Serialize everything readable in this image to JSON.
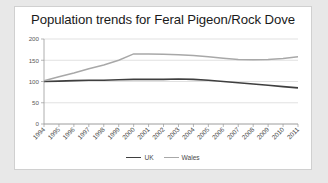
{
  "chart_data": {
    "type": "line",
    "title": "Population trends for Feral Pigeon/Rock Dove",
    "xlabel": "",
    "ylabel": "",
    "ylim": [
      0,
      200
    ],
    "yticks": [
      0,
      50,
      100,
      150,
      200
    ],
    "grid": true,
    "legend_position": "bottom",
    "categories": [
      "1994",
      "1995",
      "1996",
      "1997",
      "1998",
      "1999",
      "2000",
      "2001",
      "2002",
      "2003",
      "2004",
      "2005",
      "2006",
      "2007",
      "2008",
      "2009",
      "2010",
      "2011"
    ],
    "series": [
      {
        "name": "UK",
        "color": "#3f3f3f",
        "values": [
          100,
          101,
          102,
          103,
          103,
          104,
          105,
          105,
          105,
          106,
          105,
          103,
          100,
          97,
          94,
          91,
          88,
          85
        ]
      },
      {
        "name": "Wales",
        "color": "#a8a8a8",
        "values": [
          102,
          111,
          120,
          130,
          139,
          150,
          165,
          165,
          164,
          163,
          161,
          158,
          155,
          152,
          151,
          152,
          154,
          158
        ]
      }
    ]
  },
  "legend": {
    "items": [
      {
        "label": "UK"
      },
      {
        "label": "Wales"
      }
    ]
  }
}
